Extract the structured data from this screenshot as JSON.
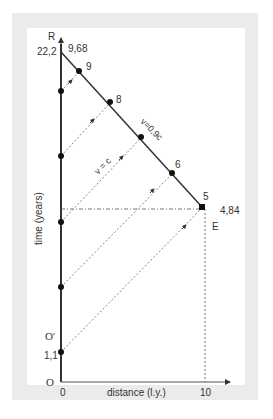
{
  "diagram": {
    "axes": {
      "y_label": "time (years)",
      "x_label": "distance (l.y.)",
      "x_ticks": [
        "0",
        "10"
      ]
    },
    "origin_labels": {
      "O": "O",
      "O_prime": "O'",
      "R": "R",
      "E": "E"
    },
    "time_labels": {
      "top_left": "22,2",
      "top_right": "9,68",
      "start": "1,1",
      "turnaround": "4,84"
    },
    "diagonal_points": [
      "9",
      "8",
      "6",
      "5"
    ],
    "line_labels": {
      "ship": "v=0,9c",
      "light": "v = c"
    },
    "colors": {
      "frame": "#ebebeb",
      "line": "#333333",
      "dashed": "#555555",
      "background": "#ffffff"
    }
  }
}
